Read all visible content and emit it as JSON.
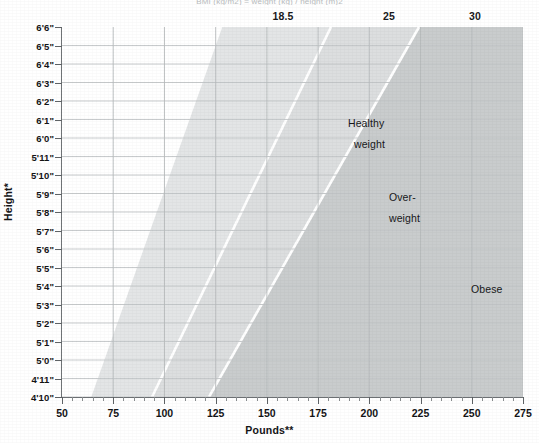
{
  "chart_data": {
    "type": "area",
    "title": "BMI (kg/m2) = weight (kg) / height (m)2",
    "xlabel": "Pounds**",
    "ylabel": "Height*",
    "xlim": [
      50,
      275
    ],
    "ylim_feet_inches": [
      "4'10\"",
      "6'6\""
    ],
    "grid": true,
    "legend": "none",
    "top_axis": {
      "label": "BMI",
      "ticks": [
        {
          "value": "18.5",
          "x_px": 283
        },
        {
          "value": "25",
          "x_px": 389
        },
        {
          "value": "30",
          "x_px": 475
        }
      ]
    },
    "x_ticks": [
      {
        "label": "50",
        "value": 50
      },
      {
        "label": "75",
        "value": 75
      },
      {
        "label": "100",
        "value": 100
      },
      {
        "label": "125",
        "value": 125
      },
      {
        "label": "150",
        "value": 150
      },
      {
        "label": "175",
        "value": 175
      },
      {
        "label": "200",
        "value": 200
      },
      {
        "label": "225",
        "value": 225
      },
      {
        "label": "250",
        "value": 250
      },
      {
        "label": "275",
        "value": 275
      }
    ],
    "x_minor_step": 5,
    "y_ticks": [
      "6'6\"",
      "6'5\"",
      "6'4\"",
      "6'3\"",
      "6'2\"",
      "6'1\"",
      "6'0\"",
      "5'11\"",
      "5'10\"",
      "5'9\"",
      "5'8\"",
      "5'7\"",
      "5'6\"",
      "5'5\"",
      "5'4\"",
      "5'3\"",
      "5'2\"",
      "5'1\"",
      "5'0\"",
      "4'11\"",
      "4'10\""
    ],
    "regions": [
      {
        "name": "underweight",
        "label": "",
        "bmi_range": [
          0,
          18.5
        ],
        "color": "#ffffff",
        "boundary_top_x_px": 0,
        "boundary_bottom_x_px": 0
      },
      {
        "name": "healthy-weight",
        "label": "Healthy weight",
        "label_line1": "Healthy",
        "label_line2": "weight",
        "bmi_range": [
          18.5,
          25
        ],
        "color": "#e3e5e6",
        "boundary_bmi": 18.5
      },
      {
        "name": "overweight",
        "label": "Over- weight",
        "label_line1": "Over-",
        "label_line2": "weight",
        "bmi_range": [
          25,
          30
        ],
        "color": "#dcdedf",
        "boundary_bmi": 25
      },
      {
        "name": "obese",
        "label": "Obese",
        "label_line1": "Obese",
        "bmi_range": [
          30,
          99
        ],
        "color": "#c9cccd",
        "boundary_bmi": 30
      }
    ],
    "boundary_lines": [
      {
        "bmi": 18.5,
        "top_x_px": 221,
        "bottom_x_px": 90,
        "color": "#ffffff"
      },
      {
        "bmi": 25.0,
        "top_x_px": 331,
        "bottom_x_px": 152,
        "color": "#ffffff"
      },
      {
        "bmi": 30.0,
        "top_x_px": 419,
        "bottom_x_px": 209,
        "color": "#ffffff"
      }
    ],
    "colors": {
      "underweight": "#ffffff",
      "healthy": "#e3e5e6",
      "overweight": "#dcdedf",
      "obese": "#c9cccd",
      "gridline": "#c2c5c7",
      "axis": "#6f7376",
      "text": "#141416"
    }
  }
}
